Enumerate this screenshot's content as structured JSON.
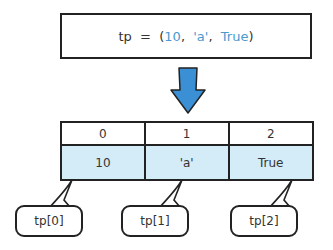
{
  "code": {
    "var": "tp",
    "op": "=",
    "open": "(",
    "items": [
      "10",
      "'a'",
      "True"
    ],
    "sep": ",",
    "close": ")"
  },
  "colors": {
    "literal": "#4a9ad0",
    "arrow": "#3b8fd4",
    "cell_fill": "#d3ecf8",
    "border": "#222222"
  },
  "table": {
    "indices": [
      "0",
      "1",
      "2"
    ],
    "values": [
      "10",
      "'a'",
      "True"
    ]
  },
  "callouts": [
    "tp[0]",
    "tp[1]",
    "tp[2]"
  ]
}
